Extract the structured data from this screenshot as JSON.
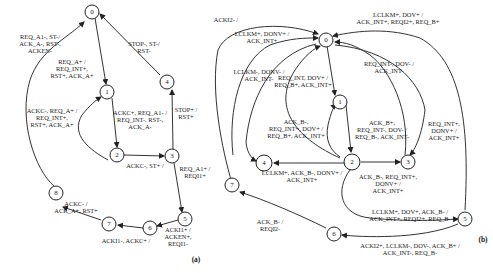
{
  "diagrams": {
    "a": {
      "caption": "(a)",
      "states": [
        "0",
        "1",
        "2",
        "3",
        "4",
        "5",
        "6",
        "7",
        "8"
      ],
      "transitions": [
        {
          "from": "8",
          "to": "0",
          "label": [
            "REQ_A1-, ST-/",
            "ACK_A-, RST-,",
            "ACKEN-"
          ]
        },
        {
          "from": "0",
          "to": "1",
          "label": [
            "REQ_A+ /",
            "REQ_INT+,",
            "RST+, ACK_A+"
          ]
        },
        {
          "from": "4",
          "to": "0",
          "label": [
            "STOP-, ST-/",
            "RST-"
          ]
        },
        {
          "from": "2",
          "to": "1",
          "label": [
            "ACKC-, REQ_A+ /",
            "REQ_INT+,",
            "RST+, ACK_A+"
          ]
        },
        {
          "from": "1",
          "to": "2",
          "label": [
            "ACKC+, REQ_A1- /",
            "REQ_INT-, RST-,",
            "ACK_A-"
          ]
        },
        {
          "from": "3",
          "to": "4",
          "label": [
            "STOP+ /",
            "RST+"
          ]
        },
        {
          "from": "2",
          "to": "3",
          "label": [
            "ACKC-, ST+ /"
          ]
        },
        {
          "from": "3",
          "to": "5",
          "label": [
            "REQ_A1+ /",
            "REQI1+"
          ]
        },
        {
          "from": "5",
          "to": "6",
          "label": [
            "ACKI1+ /",
            "ACKEN+,",
            "REQI1-"
          ]
        },
        {
          "from": "6",
          "to": "7",
          "label": [
            "ACKI1-, ACKC+ /"
          ]
        },
        {
          "from": "7",
          "to": "8",
          "label": [
            "ACKC- /",
            "ACK_A+, RST+"
          ]
        }
      ]
    },
    "b": {
      "caption": "(b)",
      "states": [
        "0",
        "1",
        "2",
        "3",
        "4",
        "5",
        "6",
        "7"
      ],
      "transitions": [
        {
          "from": "7",
          "to": "0",
          "label": [
            "ACKI2- /"
          ]
        },
        {
          "from": "4",
          "to": "0",
          "label": [
            "LCLKM+, DONV+ /",
            "ACK_INT+"
          ]
        },
        {
          "from": "0",
          "to": "4",
          "label": [
            "LCLKM-, DONV- /",
            "ACK_INT-"
          ]
        },
        {
          "from": "2",
          "to": "0",
          "label": [
            "REQ_INT, DOV+ /",
            "REQ_B+, ACK_INT+"
          ]
        },
        {
          "from": "0",
          "to": "1",
          "label": []
        },
        {
          "from": "5",
          "to": "0",
          "label": [
            "LCLKM+, DOV+ /",
            "ACK_INT+, REQI2+, REQ_B+"
          ]
        },
        {
          "from": "3",
          "to": "0",
          "label": [
            "REQ_INT-, DOV- /",
            "ACK_INT-"
          ]
        },
        {
          "from": "2",
          "to": "1",
          "label": [
            "ACK_B-,",
            "REQ_INT+, DOV+ /",
            "REQ_B+, ACK_INT+"
          ]
        },
        {
          "from": "1",
          "to": "2",
          "label": [
            "ACK_B+,",
            "REQ_INT-, DOV- /",
            "REQ_B-, ACK_INT-"
          ]
        },
        {
          "from": "0",
          "to": "3",
          "label": [
            "REQ_INT+,",
            "DONV+ /",
            "ACK_INT+"
          ]
        },
        {
          "from": "2",
          "to": "4",
          "label": [
            "LCLKM+, ACK_B-, DONV+ /",
            "ACK_INT+"
          ]
        },
        {
          "from": "2",
          "to": "3",
          "label": [
            "ACK_B-, REQ_INT+,",
            "DONV+ /",
            "ACK_INT+"
          ]
        },
        {
          "from": "2",
          "to": "5",
          "label": [
            "LCLKM+, DOV+, ACK_B- /",
            "ACK_INT+, REQI2+, REQ_B-"
          ]
        },
        {
          "from": "5",
          "to": "6",
          "label": [
            "ACKI2+, LCLKM-, DOV-, ACK_B+ /",
            "ACK_INT-, REQ_B-"
          ]
        },
        {
          "from": "6",
          "to": "7",
          "label": [
            "ACK_B- /",
            "REQI2-"
          ]
        }
      ]
    }
  }
}
